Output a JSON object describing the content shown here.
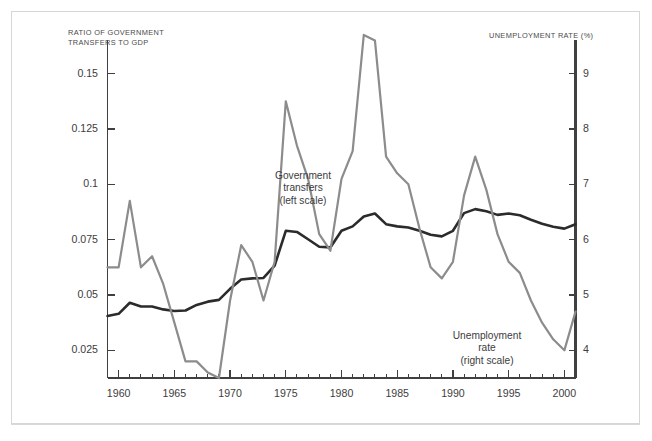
{
  "figure": {
    "left_axis_title": "RATIO OF GOVERNMENT\nTRANSFERS TO GDP",
    "right_axis_title": "UNEMPLOYMENT RATE (%)",
    "annotation_transfers": "Government\ntransfers\n(left scale)",
    "annotation_unemployment": "Unemployment\nrate\n(right scale)",
    "color_transfers": "#2b2b2b",
    "color_unemployment": "#8c8c8c",
    "color_axis": "#404040",
    "color_border": "#d6d6d6"
  },
  "chart_data": {
    "type": "line",
    "title": "",
    "subtitle": "",
    "xlabel": "",
    "ylabel": "RATIO OF GOVERNMENT TRANSFERS TO GDP",
    "y2label": "UNEMPLOYMENT RATE (%)",
    "xlim": [
      1959,
      2001
    ],
    "ylim": [
      0.0125,
      0.1625
    ],
    "y2lim": [
      3.5,
      9.5
    ],
    "yticks": [
      0.025,
      0.05,
      0.075,
      0.1,
      0.125,
      0.15
    ],
    "ytick_labels": [
      "0.025",
      "0.05",
      "0.075",
      "0.1",
      "0.125",
      "0.15"
    ],
    "y2ticks": [
      4,
      5,
      6,
      7,
      8,
      9
    ],
    "y2tick_labels": [
      "4",
      "5",
      "6",
      "7",
      "8",
      "9"
    ],
    "xticks": [
      1960,
      1965,
      1970,
      1975,
      1980,
      1985,
      1990,
      1995,
      2000
    ],
    "xtick_labels": [
      "1960",
      "1965",
      "1970",
      "1975",
      "1980",
      "1985",
      "1990",
      "1995",
      "2000"
    ],
    "minor_xticks_every": 1,
    "grid": false,
    "legend": "in-plot annotations",
    "x": [
      1959,
      1960,
      1961,
      1962,
      1963,
      1964,
      1965,
      1966,
      1967,
      1968,
      1969,
      1970,
      1971,
      1972,
      1973,
      1974,
      1975,
      1976,
      1977,
      1978,
      1979,
      1980,
      1981,
      1982,
      1983,
      1984,
      1985,
      1986,
      1987,
      1988,
      1989,
      1990,
      1991,
      1992,
      1993,
      1994,
      1995,
      1996,
      1997,
      1998,
      1999,
      2000,
      2001
    ],
    "series": [
      {
        "name": "Government transfers",
        "axis": "left",
        "color": "#2b2b2b",
        "label": "Government transfers (left scale)",
        "values": [
          0.0405,
          0.0415,
          0.0465,
          0.0448,
          0.0448,
          0.0435,
          0.0428,
          0.043,
          0.0455,
          0.047,
          0.0478,
          0.0528,
          0.057,
          0.0575,
          0.0577,
          0.0633,
          0.079,
          0.0785,
          0.0752,
          0.0718,
          0.0715,
          0.079,
          0.081,
          0.0855,
          0.0868,
          0.082,
          0.081,
          0.0805,
          0.079,
          0.0772,
          0.0765,
          0.079,
          0.087,
          0.0888,
          0.0878,
          0.0862,
          0.0868,
          0.086,
          0.084,
          0.0822,
          0.0808,
          0.08,
          0.082
        ]
      },
      {
        "name": "Unemployment rate",
        "axis": "right",
        "color": "#8c8c8c",
        "label": "Unemployment rate (right scale)",
        "values": [
          5.5,
          5.5,
          6.7,
          5.5,
          5.7,
          5.2,
          4.5,
          3.8,
          3.8,
          3.6,
          3.5,
          4.9,
          5.9,
          5.6,
          4.9,
          5.6,
          8.5,
          7.7,
          7.1,
          6.1,
          5.8,
          7.1,
          7.6,
          9.7,
          9.6,
          7.5,
          7.2,
          7.0,
          6.2,
          5.5,
          5.3,
          5.6,
          6.8,
          7.5,
          6.9,
          6.1,
          5.6,
          5.4,
          4.9,
          4.5,
          4.2,
          4.0,
          4.7
        ]
      }
    ]
  }
}
